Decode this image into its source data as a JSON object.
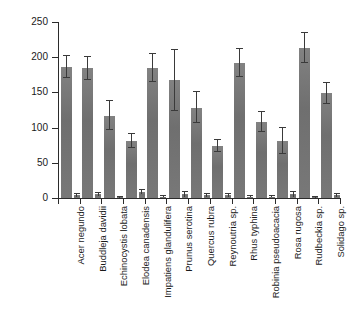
{
  "chart_data": {
    "type": "bar",
    "title": "",
    "subtitle": "",
    "xlabel": "",
    "ylabel": "Mean distance (km)",
    "ylim": [
      0,
      250
    ],
    "yticks": [
      0,
      50,
      100,
      150,
      200,
      250
    ],
    "ytick_labels": [
      "0",
      "50",
      "100",
      "150",
      "200",
      "250"
    ],
    "grid": false,
    "legend": null,
    "categories": [
      "Acer negundo",
      "Buddleja davidii",
      "Echinocystis lobata",
      "Elodea canadensis",
      "Impatiens glandulifera",
      "Prunus serotina",
      "Quercus rubra",
      "Reynoutria sp.",
      "Rhus typhina",
      "Robinia pseudoacacia",
      "Rosa rugosa",
      "Rudbeckia sp.",
      "Solidago sp."
    ],
    "series": [
      {
        "name": "Mean distance",
        "values": [
          186,
          184,
          117,
          81,
          185,
          167,
          128,
          74,
          192,
          108,
          81,
          213,
          149
        ],
        "errors": [
          16,
          17,
          21,
          10,
          20,
          43,
          22,
          9,
          20,
          14,
          19,
          21,
          15
        ]
      },
      {
        "name": "Secondary",
        "values": [
          4,
          5,
          1,
          8,
          2,
          5,
          4,
          4,
          2,
          2,
          5,
          1,
          4
        ],
        "errors": [
          2,
          2,
          1,
          3,
          1,
          3,
          2,
          2,
          1,
          1,
          3,
          1,
          2
        ]
      }
    ],
    "bar_color": "#787878",
    "error_color": "#3a3a3a",
    "axis_color": "#2b2b2b"
  }
}
